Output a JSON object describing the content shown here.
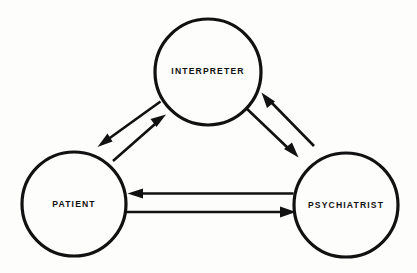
{
  "diagram": {
    "type": "triad-relationship-diagram",
    "background_color": "#fdfdfc",
    "stroke_color": "#111111",
    "nodes": [
      {
        "id": "interpreter",
        "label": "INTERPRETER",
        "cx": 208,
        "cy": 72,
        "r": 53
      },
      {
        "id": "patient",
        "label": "PATIENT",
        "cx": 74,
        "cy": 204,
        "r": 52
      },
      {
        "id": "psychiatrist",
        "label": "PSYCHIATRIST",
        "cx": 346,
        "cy": 205,
        "r": 52
      }
    ],
    "edges": [
      {
        "id": "interpreter-to-patient",
        "from": "interpreter",
        "to": "patient",
        "direction": "down-left",
        "tail": [
          157,
          104
        ],
        "head": [
          99,
          146
        ]
      },
      {
        "id": "patient-to-interpreter",
        "from": "patient",
        "to": "interpreter",
        "direction": "up-right",
        "tail": [
          114,
          160
        ],
        "head": [
          164,
          114
        ]
      },
      {
        "id": "psychiatrist-to-interpreter",
        "from": "psychiatrist",
        "to": "interpreter",
        "direction": "up-left",
        "tail": [
          315,
          147
        ],
        "head": [
          261,
          92
        ]
      },
      {
        "id": "interpreter-to-psychiatrist",
        "from": "interpreter",
        "to": "psychiatrist",
        "direction": "down-right",
        "tail": [
          245,
          107
        ],
        "head": [
          298,
          157
        ]
      },
      {
        "id": "psychiatrist-to-patient",
        "from": "psychiatrist",
        "to": "patient",
        "direction": "left",
        "tail": [
          294,
          194
        ],
        "head": [
          128,
          194
        ]
      },
      {
        "id": "patient-to-psychiatrist",
        "from": "patient",
        "to": "psychiatrist",
        "direction": "right",
        "tail": [
          126,
          212
        ],
        "head": [
          296,
          212
        ]
      }
    ]
  }
}
